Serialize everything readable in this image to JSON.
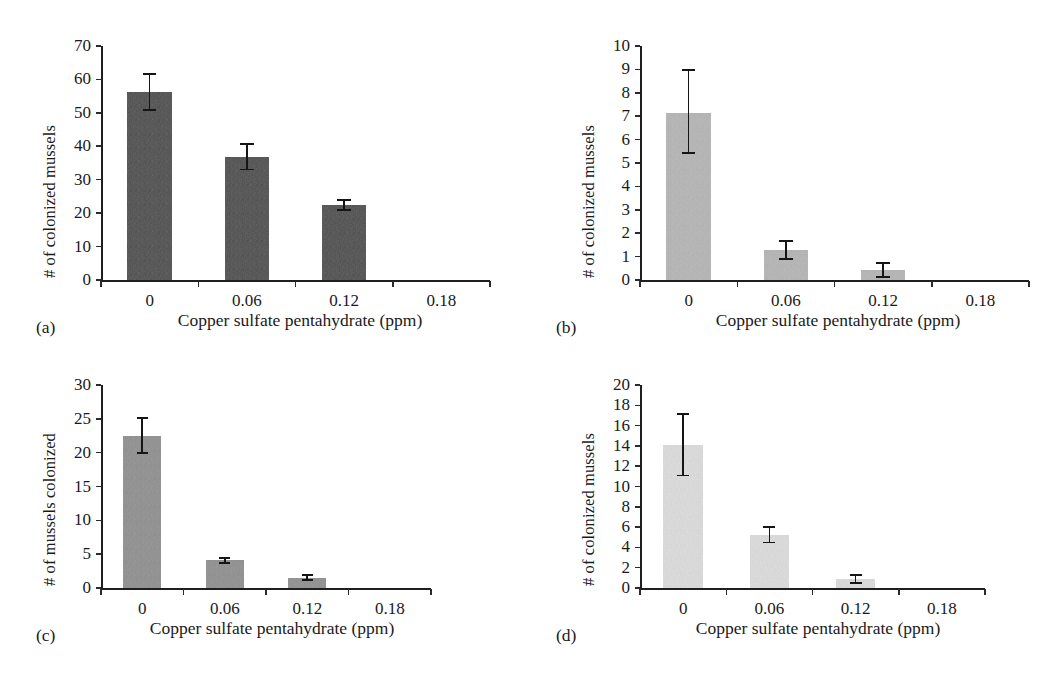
{
  "figure": {
    "width": 1063,
    "height": 687,
    "background": "#ffffff",
    "panel_count": 4
  },
  "shared": {
    "xlabel": "Copper sulfate pentahydrate (ppm)",
    "x_categories": [
      "0",
      "0.06",
      "0.12",
      "0.18"
    ],
    "axis_color": "#1f1f1f"
  },
  "chart_data": [
    {
      "panel": "(a)",
      "type": "bar",
      "title": "",
      "xlabel": "Copper sulfate pentahydrate (ppm)",
      "ylabel": "# of colonized mussels",
      "categories": [
        "0",
        "0.06",
        "0.12",
        "0.18"
      ],
      "values": [
        56.2,
        36.8,
        22.4,
        0
      ],
      "errors_low": [
        50.6,
        32.8,
        20.6,
        0
      ],
      "errors_high": [
        62.0,
        41.0,
        24.2,
        0
      ],
      "ylim": [
        0,
        70
      ],
      "yticks": [
        0,
        10,
        20,
        30,
        40,
        50,
        60,
        70
      ],
      "ytick_labels": [
        "0",
        "10",
        "20",
        "30",
        "40",
        "50",
        "60",
        "70"
      ],
      "bar_color": "#4d4d4d",
      "grid": false,
      "legend": "none"
    },
    {
      "panel": "(b)",
      "type": "bar",
      "title": "",
      "xlabel": "Copper sulfate pentahydrate (ppm)",
      "ylabel": "# of colonized mussels",
      "categories": [
        "0",
        "0.06",
        "0.12",
        "0.18"
      ],
      "values": [
        7.15,
        1.3,
        0.42,
        0
      ],
      "errors_low": [
        5.4,
        0.85,
        0.1,
        0
      ],
      "errors_high": [
        9.0,
        1.72,
        0.78,
        0
      ],
      "ylim": [
        0,
        10
      ],
      "yticks": [
        0,
        1,
        2,
        3,
        4,
        5,
        6,
        7,
        8,
        9,
        10
      ],
      "ytick_labels": [
        "0",
        "1",
        "2",
        "3",
        "4",
        "5",
        "6",
        "7",
        "8",
        "9",
        "10"
      ],
      "bar_color": "#b4b4b4",
      "grid": false,
      "legend": "none"
    },
    {
      "panel": "(c)",
      "type": "bar",
      "title": "",
      "xlabel": "Copper sulfate pentahydrate (ppm)",
      "ylabel": "# of mussels colonized",
      "categories": [
        "0",
        "0.06",
        "0.12",
        "0.18"
      ],
      "values": [
        22.5,
        4.1,
        1.5,
        0
      ],
      "errors_low": [
        19.8,
        3.6,
        1.0,
        0
      ],
      "errors_high": [
        25.2,
        4.6,
        2.0,
        0
      ],
      "ylim": [
        0,
        30
      ],
      "yticks": [
        0,
        5,
        10,
        15,
        20,
        25,
        30
      ],
      "ytick_labels": [
        "0",
        "5",
        "10",
        "15",
        "20",
        "25",
        "30"
      ],
      "bar_color": "#8e8e8e",
      "grid": false,
      "legend": "none"
    },
    {
      "panel": "(d)",
      "type": "bar",
      "title": "",
      "xlabel": "Copper sulfate pentahydrate (ppm)",
      "ylabel": "# of colonized mussels",
      "categories": [
        "0",
        "0.06",
        "0.12",
        "0.18"
      ],
      "values": [
        14.1,
        5.2,
        0.9,
        0
      ],
      "errors_low": [
        11.0,
        4.4,
        0.4,
        0
      ],
      "errors_high": [
        17.2,
        6.1,
        1.4,
        0
      ],
      "ylim": [
        0,
        20
      ],
      "yticks": [
        0,
        2,
        4,
        6,
        8,
        10,
        12,
        14,
        16,
        18,
        20
      ],
      "ytick_labels": [
        "0",
        "2",
        "4",
        "6",
        "8",
        "10",
        "12",
        "14",
        "16",
        "18",
        "20"
      ],
      "bar_color": "#dcdcdc",
      "grid": false,
      "legend": "none"
    }
  ]
}
